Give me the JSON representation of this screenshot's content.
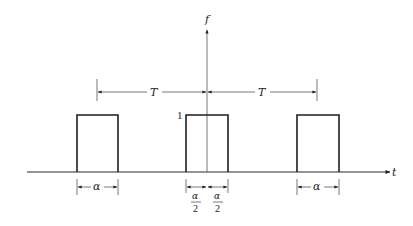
{
  "diagram": {
    "axes": {
      "vertical_label": "f",
      "horizontal_label": "t"
    },
    "amplitude_label": "1",
    "period_label": "T",
    "pulse_width_label": "α",
    "half_width": {
      "numerator": "α",
      "denominator": "2"
    },
    "pulses": [
      {
        "name": "left",
        "center": "-T"
      },
      {
        "name": "center",
        "center": "0"
      },
      {
        "name": "right",
        "center": "T"
      }
    ]
  }
}
